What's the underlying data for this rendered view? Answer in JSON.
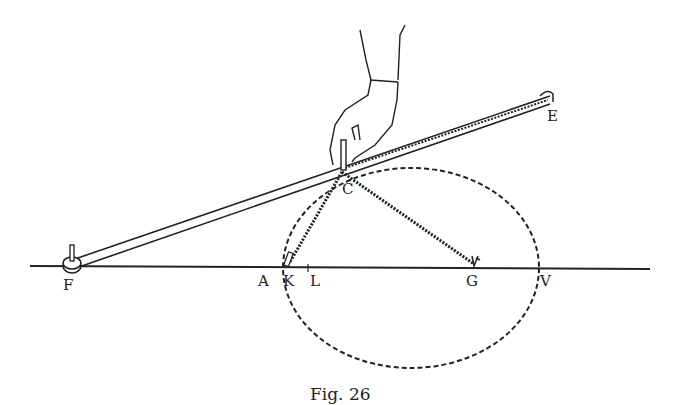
{
  "figure": {
    "caption": "Fig. 26",
    "labels": {
      "F": "F",
      "E": "E",
      "C": "C",
      "A": "A",
      "K": "K",
      "L": "L",
      "G": "G",
      "V": "V"
    },
    "elements": [
      "baseline",
      "ruler-FE",
      "string-KC",
      "string-CG",
      "dashed-ellipse",
      "hand-with-pencil",
      "pin-F",
      "pin-K",
      "pin-G"
    ],
    "colors": {
      "ink": "#222222",
      "background": "#ffffff"
    }
  }
}
